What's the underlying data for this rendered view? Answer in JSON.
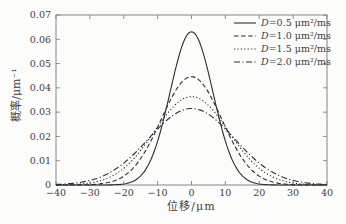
{
  "figure": {
    "background": "#fcfcfa",
    "axis_color": "#858585",
    "text_color": "#3e3e3e",
    "curve_color": "#2e2e2e"
  },
  "chart_data": {
    "type": "line",
    "title": "",
    "xlabel": "位移/μm",
    "ylabel": "概率/μm⁻¹",
    "xlim": [
      -40,
      40
    ],
    "ylim": [
      0,
      0.07
    ],
    "x_ticks": [
      -40,
      -30,
      -20,
      -10,
      0,
      10,
      20,
      30,
      40
    ],
    "y_tick_labels": [
      "0",
      "0.01",
      "0.02",
      "0.03",
      "0.04",
      "0.05",
      "0.06",
      "0.07"
    ],
    "grid": false,
    "legend_position": "inside-top-right",
    "curve_model": "gaussian p(x) = peak · exp(-x² / (2·sigma²))",
    "x_samples": [
      -40,
      -35,
      -30,
      -25,
      -20,
      -15,
      -10,
      -5,
      0,
      5,
      10,
      15,
      20,
      25,
      30,
      35,
      40
    ],
    "series": [
      {
        "label": "D=0.5 μm²/ms",
        "D": 0.5,
        "sigma": 6.32,
        "peak": 0.0631,
        "linestyle": "solid",
        "y_samples": [
          0,
          0,
          0,
          0,
          0.0004,
          0.0038,
          0.0181,
          0.0461,
          0.0631,
          0.0461,
          0.0181,
          0.0038,
          0.0004,
          0,
          0,
          0,
          0
        ]
      },
      {
        "label": "D=1.0 μm²/ms",
        "D": 1.0,
        "sigma": 8.94,
        "peak": 0.0446,
        "linestyle": "dashed",
        "y_samples": [
          0,
          0,
          0.0002,
          0.0009,
          0.0037,
          0.0109,
          0.0239,
          0.0382,
          0.0446,
          0.0382,
          0.0239,
          0.0109,
          0.0037,
          0.0009,
          0.0002,
          0,
          0
        ]
      },
      {
        "label": "D=1.5 μm²/ms",
        "D": 1.5,
        "sigma": 10.95,
        "peak": 0.0364,
        "linestyle": "dotted",
        "y_samples": [
          0,
          0.0002,
          0.0009,
          0.0027,
          0.0069,
          0.0143,
          0.024,
          0.0328,
          0.0364,
          0.0328,
          0.024,
          0.0143,
          0.0069,
          0.0027,
          0.0009,
          0.0002,
          0
        ]
      },
      {
        "label": "D=2.0 μm²/ms",
        "D": 2.0,
        "sigma": 12.65,
        "peak": 0.0315,
        "linestyle": "dashdot",
        "y_samples": [
          0.0002,
          0.0007,
          0.0019,
          0.0045,
          0.009,
          0.0156,
          0.0231,
          0.0292,
          0.0315,
          0.0292,
          0.0231,
          0.0156,
          0.009,
          0.0045,
          0.0019,
          0.0007,
          0.0002
        ]
      }
    ]
  }
}
